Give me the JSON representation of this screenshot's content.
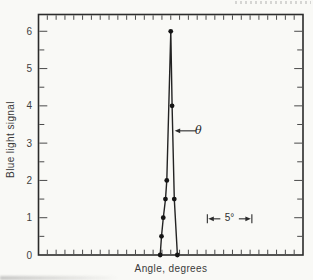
{
  "figure": {
    "caption_area_text": "",
    "ink_color": "#2b2b2b",
    "paper_color": "#f9f9f6"
  },
  "chart_data": {
    "type": "line",
    "title": "",
    "xlabel": "Angle, degrees",
    "ylabel": "Blue light signal",
    "xlim": [
      -15,
      15
    ],
    "ylim": [
      0,
      6.45
    ],
    "x_tick_step_degrees": 1,
    "y_major_ticks": [
      0,
      1,
      2,
      3,
      4,
      5,
      6
    ],
    "y_minor_tick_step": 0.5,
    "grid": false,
    "legend": "none",
    "series": [
      {
        "name": "blue-light-signal-vs-angle",
        "marker": "filled-circle",
        "points": [
          {
            "angle_deg": -1.2,
            "signal": 0
          },
          {
            "angle_deg": -1.05,
            "signal": 0.5
          },
          {
            "angle_deg": -0.85,
            "signal": 1.0
          },
          {
            "angle_deg": -0.6,
            "signal": 1.5
          },
          {
            "angle_deg": -0.45,
            "signal": 2.0
          },
          {
            "angle_deg": 0.0,
            "signal": 6.0
          },
          {
            "angle_deg": 0.15,
            "signal": 4.0
          },
          {
            "angle_deg": 0.4,
            "signal": 1.5
          },
          {
            "angle_deg": 0.75,
            "signal": 0
          }
        ]
      }
    ],
    "annotations": {
      "theta": {
        "label": "θ",
        "y": 3.33,
        "arrow_tip_deg": 0.45,
        "arrow_tail_deg": 2.85
      },
      "scale_bar": {
        "label": "5°",
        "span_degrees": 5,
        "from_deg": 4.15,
        "to_deg": 9.2,
        "y": 0.97
      }
    }
  }
}
